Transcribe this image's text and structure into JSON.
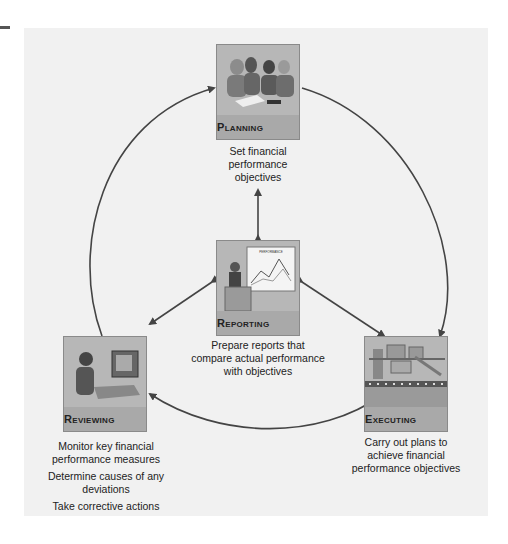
{
  "diagram": {
    "type": "cycle",
    "nodes": {
      "planning": {
        "title": "Planning",
        "icon": "meeting-people-icon",
        "caption": [
          "Set financial performance objectives"
        ]
      },
      "executing": {
        "title": "Executing",
        "icon": "factory-machinery-icon",
        "caption": [
          "Carry out plans to achieve financial performance objectives"
        ]
      },
      "reviewing": {
        "title": "Reviewing",
        "icon": "person-at-computer-icon",
        "caption": [
          "Monitor key financial performance measures",
          "Determine causes of any deviations",
          "Take corrective actions"
        ]
      },
      "reporting": {
        "title": "Reporting",
        "icon": "presenter-chart-icon",
        "chart_label": "PERFORMANCE",
        "caption": [
          "Prepare reports that compare actual performance with objectives"
        ]
      }
    },
    "edges": [
      {
        "from": "planning",
        "to": "executing",
        "kind": "cycle"
      },
      {
        "from": "executing",
        "to": "reviewing",
        "kind": "cycle"
      },
      {
        "from": "reviewing",
        "to": "planning",
        "kind": "cycle"
      },
      {
        "from": "reporting",
        "to": "planning",
        "kind": "bidirectional"
      },
      {
        "from": "reporting",
        "to": "executing",
        "kind": "bidirectional"
      },
      {
        "from": "reporting",
        "to": "reviewing",
        "kind": "bidirectional"
      }
    ],
    "colors": {
      "panel": "#f1f1f1",
      "box": "#a9a9a9",
      "arrow": "#444444",
      "text": "#222222"
    }
  }
}
